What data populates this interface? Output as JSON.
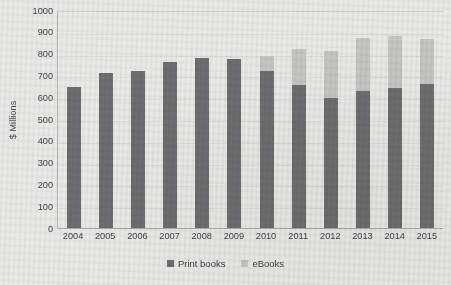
{
  "chart_data": {
    "type": "bar",
    "stacked": true,
    "title": "",
    "subtitle": "",
    "xlabel": "",
    "ylabel": "$ Millions",
    "ylim": [
      0,
      1000
    ],
    "ytick_step": 100,
    "ytick_labels": [
      "1000",
      "900",
      "800",
      "700",
      "600",
      "500",
      "400",
      "300",
      "200",
      "100",
      "0"
    ],
    "grid": true,
    "grid_orientation": "horizontal",
    "legend_position": "bottom",
    "categories": [
      "2004",
      "2005",
      "2006",
      "2007",
      "2008",
      "2009",
      "2010",
      "2011",
      "2012",
      "2013",
      "2014",
      "2015"
    ],
    "series": [
      {
        "name": "Print books",
        "color": "#6e6e70",
        "values": [
          645,
          710,
          718,
          760,
          780,
          775,
          718,
          658,
          598,
          628,
          640,
          660
        ]
      },
      {
        "name": "eBooks",
        "color": "#c6c6c4",
        "values": [
          0,
          0,
          0,
          0,
          0,
          0,
          72,
          162,
          212,
          245,
          242,
          208
        ]
      }
    ],
    "totals": [
      645,
      710,
      718,
      760,
      780,
      775,
      790,
      820,
      810,
      873,
      882,
      868
    ]
  },
  "legend": {
    "entries": [
      {
        "label": "Print books",
        "color": "#6e6e70",
        "swatch_name": "print-books-swatch"
      },
      {
        "label": "eBooks",
        "color": "#c6c6c4",
        "swatch_name": "ebooks-swatch"
      }
    ]
  },
  "colors": {
    "print_books": "#6e6e70",
    "ebooks": "#c6c6c4",
    "background": "#e9e9e7",
    "gridline": "#dcdcd9",
    "axis": "#a9a9a6",
    "text": "#3f3f44"
  }
}
